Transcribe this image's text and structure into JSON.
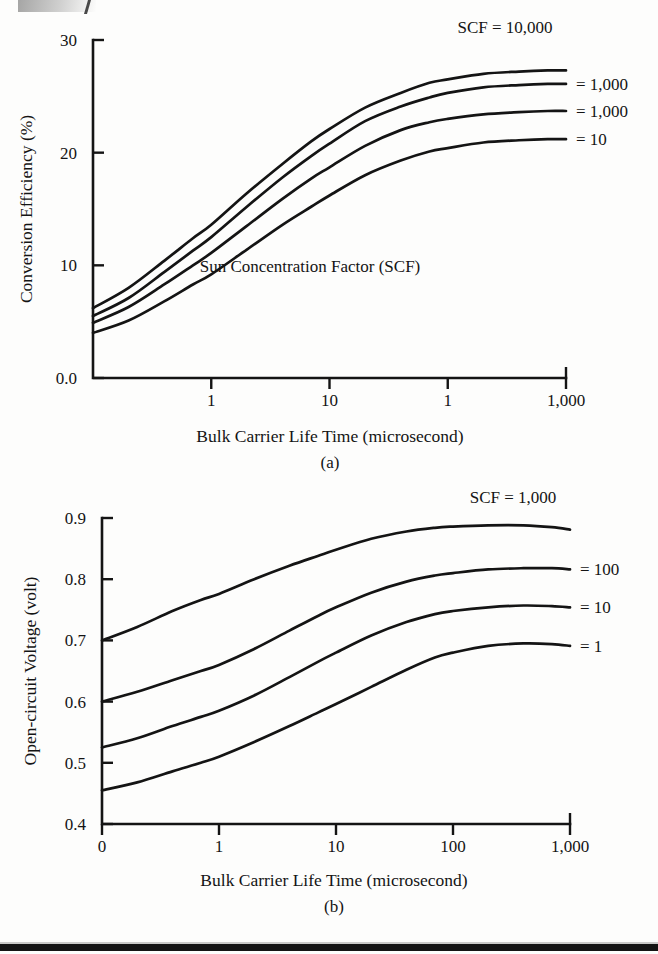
{
  "figure": {
    "panel_a_caption": "(a)",
    "panel_b_caption": "(b)",
    "line_color": "#141414",
    "background_color": "#fdfdfc"
  },
  "chart_data": [
    {
      "id": "panel-a",
      "type": "line",
      "title": "",
      "caption": "(a)",
      "xlabel": "Bulk Carrier Life Time (microsecond)",
      "ylabel": "Conversion Efficiency (%)",
      "annotation": "Sun Concentration Factor (SCF)",
      "x_scale": "log",
      "x_tick_labels": [
        "1",
        "10",
        "1",
        "1,000"
      ],
      "x_tick_values": [
        1,
        10,
        100,
        1000
      ],
      "xlim": [
        0.1,
        1000
      ],
      "y_tick_labels": [
        "0.0",
        "10",
        "20",
        "30"
      ],
      "y_tick_values": [
        0,
        10,
        20,
        30
      ],
      "ylim": [
        0,
        30
      ],
      "grid": false,
      "legend_position": "right",
      "series": [
        {
          "name": "SCF = 10,000",
          "label": "SCF = 10,000",
          "x": [
            0.1,
            0.2,
            0.4,
            0.7,
            1,
            2,
            4,
            7,
            10,
            20,
            40,
            70,
            100,
            200,
            400,
            700,
            1000
          ],
          "values": [
            6.2,
            8.0,
            10.4,
            12.4,
            13.6,
            16.4,
            19.0,
            21.0,
            22.1,
            24.0,
            25.3,
            26.2,
            26.5,
            27.0,
            27.2,
            27.3,
            27.3
          ]
        },
        {
          "name": "= 1,000",
          "label": "= 1,000",
          "x": [
            0.1,
            0.2,
            0.4,
            0.7,
            1,
            2,
            4,
            7,
            10,
            20,
            40,
            70,
            100,
            200,
            400,
            700,
            1000
          ],
          "values": [
            5.5,
            7.1,
            9.4,
            11.3,
            12.5,
            15.2,
            17.8,
            19.7,
            20.8,
            22.8,
            24.1,
            24.9,
            25.3,
            25.8,
            26.0,
            26.1,
            26.1
          ]
        },
        {
          "name": "= 1,000 (lower)",
          "label": "= 1,000",
          "x": [
            0.1,
            0.2,
            0.4,
            0.7,
            1,
            2,
            4,
            7,
            10,
            20,
            40,
            70,
            100,
            200,
            400,
            700,
            1000
          ],
          "values": [
            4.9,
            6.3,
            8.3,
            10.0,
            11.1,
            13.5,
            15.9,
            17.7,
            18.7,
            20.6,
            22.0,
            22.7,
            23.0,
            23.4,
            23.6,
            23.7,
            23.7
          ]
        },
        {
          "name": "= 10",
          "label": "= 10",
          "x": [
            0.1,
            0.2,
            0.4,
            0.7,
            1,
            2,
            4,
            7,
            10,
            20,
            40,
            70,
            100,
            200,
            400,
            700,
            1000
          ],
          "values": [
            4.0,
            5.1,
            6.8,
            8.3,
            9.2,
            11.4,
            13.6,
            15.2,
            16.2,
            18.0,
            19.3,
            20.1,
            20.4,
            20.9,
            21.1,
            21.2,
            21.2
          ]
        }
      ]
    },
    {
      "id": "panel-b",
      "type": "line",
      "title": "",
      "caption": "(b)",
      "xlabel": "Bulk Carrier Life Time (microsecond)",
      "ylabel": "Open-circuit Voltage (volt)",
      "annotation": "",
      "x_scale": "log",
      "x_tick_labels": [
        "0",
        "1",
        "10",
        "100",
        "1,000"
      ],
      "x_tick_values": [
        0,
        1,
        10,
        100,
        1000
      ],
      "xlim": [
        0.1,
        1000
      ],
      "y_tick_labels": [
        "0.4",
        "0.5",
        "0.6",
        "0.7",
        "0.8",
        "0.9"
      ],
      "y_tick_values": [
        0.4,
        0.5,
        0.6,
        0.7,
        0.8,
        0.9
      ],
      "ylim": [
        0.4,
        0.9
      ],
      "grid": false,
      "legend_position": "right",
      "series": [
        {
          "name": "SCF = 1,000",
          "label": "SCF = 1,000",
          "x": [
            0.1,
            0.2,
            0.4,
            0.7,
            1,
            2,
            4,
            7,
            10,
            20,
            40,
            70,
            100,
            200,
            400,
            700,
            1000
          ],
          "values": [
            0.7,
            0.722,
            0.748,
            0.766,
            0.776,
            0.8,
            0.822,
            0.838,
            0.848,
            0.866,
            0.878,
            0.884,
            0.886,
            0.888,
            0.888,
            0.885,
            0.881
          ]
        },
        {
          "name": "= 100",
          "label": "= 100",
          "x": [
            0.1,
            0.2,
            0.4,
            0.7,
            1,
            2,
            4,
            7,
            10,
            20,
            40,
            70,
            100,
            200,
            400,
            700,
            1000
          ],
          "values": [
            0.6,
            0.616,
            0.635,
            0.65,
            0.66,
            0.686,
            0.716,
            0.74,
            0.754,
            0.778,
            0.796,
            0.806,
            0.81,
            0.816,
            0.818,
            0.818,
            0.816
          ]
        },
        {
          "name": "= 10",
          "label": "= 10",
          "x": [
            0.1,
            0.2,
            0.4,
            0.7,
            1,
            2,
            4,
            7,
            10,
            20,
            40,
            70,
            100,
            200,
            400,
            700,
            1000
          ],
          "values": [
            0.525,
            0.54,
            0.56,
            0.575,
            0.585,
            0.61,
            0.64,
            0.665,
            0.68,
            0.708,
            0.73,
            0.743,
            0.748,
            0.754,
            0.757,
            0.756,
            0.754
          ]
        },
        {
          "name": "= 1",
          "label": "= 1",
          "x": [
            0.1,
            0.2,
            0.4,
            0.7,
            1,
            2,
            4,
            7,
            10,
            20,
            40,
            70,
            100,
            200,
            400,
            700,
            1000
          ],
          "values": [
            0.455,
            0.468,
            0.486,
            0.5,
            0.51,
            0.534,
            0.56,
            0.582,
            0.596,
            0.624,
            0.652,
            0.672,
            0.68,
            0.691,
            0.695,
            0.694,
            0.691
          ]
        }
      ]
    }
  ]
}
